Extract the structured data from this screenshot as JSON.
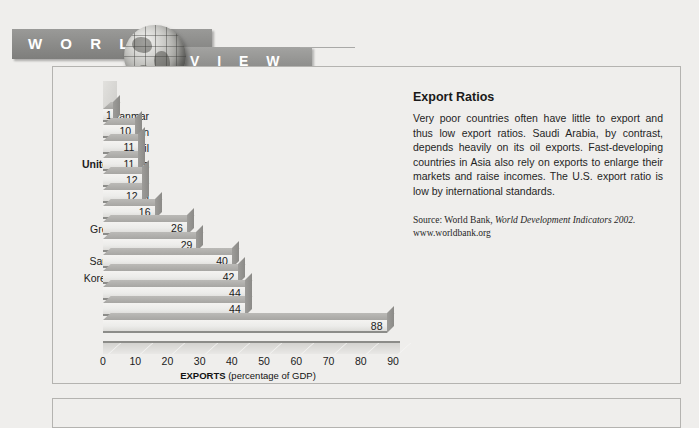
{
  "banner": {
    "word_left": "W O R L D",
    "word_right": "V I E W",
    "globe_icon": "globe-icon"
  },
  "panel": {
    "title": "Export Ratios",
    "body": "Very poor countries often have little to export and thus low export ratios. Saudi Arabia, by contrast, depends heavily on its oil exports. Fast-developing countries in Asia also rely on exports to enlarge their markets and raise incomes. The U.S. export ratio is low by international standards.",
    "source_prefix": "Source: World Bank, ",
    "source_italic": "World Development Indicators 2002.",
    "source_url": "www.worldbank.org"
  },
  "chart_data": {
    "type": "bar",
    "orientation": "horizontal",
    "title": "Export Ratios",
    "xlabel": "EXPORTS (percentage of GDP)",
    "xlabel_bold": "EXPORTS",
    "xlabel_rest": " (percentage of GDP)",
    "ylabel": "",
    "xlim": [
      0,
      90
    ],
    "xticks": [
      0,
      10,
      20,
      30,
      40,
      50,
      60,
      70,
      80,
      90
    ],
    "grid": false,
    "legend": false,
    "highlighted_category": "United States",
    "categories": [
      "Myanmar",
      "Japan",
      "Brazil",
      "United States",
      "Haiti",
      "India",
      "Egypt",
      "Great Britain",
      "Germany",
      "Saudi Arabia",
      "Korea (South)",
      "Canada",
      "Sweden",
      "Ireland"
    ],
    "values": [
      1,
      10,
      11,
      11,
      12,
      12,
      16,
      26,
      29,
      40,
      42,
      44,
      44,
      88
    ]
  }
}
